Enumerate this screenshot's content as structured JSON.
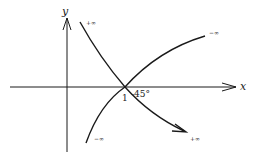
{
  "diagram": {
    "axes": {
      "x_label": "x",
      "y_label": "y"
    },
    "intersection": {
      "x_tick_label": "1",
      "angle_label": "-45°"
    },
    "curves": [
      {
        "name": "decreasing-curve",
        "start_label": "+∞",
        "end_label": "+∞",
        "has_arrow": true
      },
      {
        "name": "increasing-curve",
        "start_label": "−∞",
        "end_label": "−∞",
        "has_arrow": false
      }
    ],
    "colors": {
      "stroke": "#1a1a1a",
      "background": "#ffffff"
    }
  }
}
